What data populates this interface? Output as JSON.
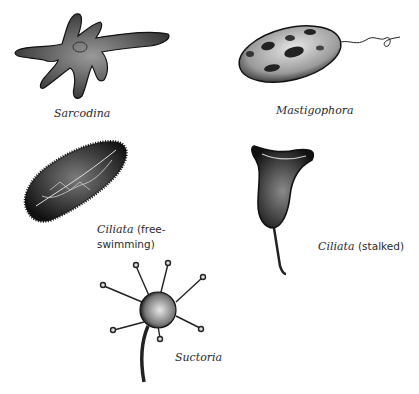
{
  "figure": {
    "organisms": [
      {
        "id": "sarcodina",
        "name": "Sarcodina",
        "qualifier": ""
      },
      {
        "id": "mastigophora",
        "name": "Mastigophora",
        "qualifier": ""
      },
      {
        "id": "ciliata-free",
        "name": "Ciliata",
        "qualifier": "(free-",
        "qualifier_line2": "swimming)"
      },
      {
        "id": "ciliata-stalked",
        "name": "Ciliata",
        "qualifier": "(stalked)"
      },
      {
        "id": "suctoria",
        "name": "Suctoria",
        "qualifier": ""
      }
    ]
  },
  "colors": {
    "ink": "#1a1a1a",
    "shade": "#555555",
    "background": "#ffffff"
  }
}
